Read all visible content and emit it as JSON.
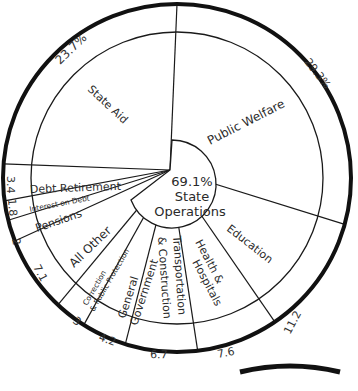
{
  "chart_data": {
    "type": "pie",
    "title": "",
    "unit": "%",
    "slices": [
      {
        "label": "Public Welfare",
        "value": 29.3,
        "value_label": "29.3%"
      },
      {
        "label": "Education",
        "value": 11.2,
        "value_label": "11.2"
      },
      {
        "label": "Health & Hospitals",
        "value": 7.6,
        "value_label": "7.6"
      },
      {
        "label": "Transportation & Construction",
        "value": 6.7,
        "value_label": "6.7"
      },
      {
        "label": "General Government",
        "value": 4.2,
        "value_label": "4.2"
      },
      {
        "label": "Correction & Public Protection",
        "value": 3.0,
        "value_label": "3"
      },
      {
        "label": "All Other",
        "value": 7.1,
        "value_label": "7.1"
      },
      {
        "label": "Pensions",
        "value": 2.0,
        "value_label": "2"
      },
      {
        "label": "Interest on Debt",
        "value": 1.8,
        "value_label": "1.8"
      },
      {
        "label": "Debt Retirement",
        "value": 3.4,
        "value_label": "3.4"
      },
      {
        "label": "State Aid",
        "value": 23.7,
        "value_label": "23.7%"
      }
    ],
    "group": {
      "label": "State Operations",
      "value": 69.1,
      "value_label": "69.1%",
      "members": [
        "Public Welfare",
        "Education",
        "Health & Hospitals",
        "Transportation & Construction",
        "General Government",
        "Correction & Public Protection",
        "All Other"
      ]
    },
    "start_angle_deg": 0,
    "direction": "clockwise"
  },
  "center": {
    "value": "69.1%",
    "line1": "State",
    "line2": "Operations"
  },
  "labels": {
    "public_welfare": "Public Welfare",
    "education": "Education",
    "health_1": "Health &",
    "health_2": "Hospitals",
    "transport_1": "Transportation",
    "transport_2": "& Construction",
    "general_1": "General",
    "general_2": "Government",
    "correction_1": "Correction",
    "correction_2": "& Public Protection",
    "all_other": "All Other",
    "pensions": "Pensions",
    "interest": "Interest on Debt",
    "debt_retirement": "Debt Retirement",
    "state_aid": "State Aid"
  },
  "values": {
    "public_welfare": "29.3%",
    "education": "11.2",
    "health": "7.6",
    "transport": "6.7",
    "general": "4.2",
    "correction": "3",
    "all_other": "7.1",
    "pensions": "2",
    "interest": "1.8",
    "debt_retirement": "3.4",
    "state_aid": "23.7%"
  }
}
